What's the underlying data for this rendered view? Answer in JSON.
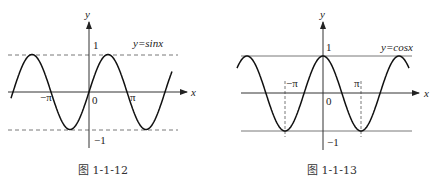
{
  "figures": [
    {
      "id": "left",
      "caption": "图 1-1-12",
      "function_label": "y=sinx",
      "axis_x_label": "x",
      "axis_y_label": "y",
      "origin_label": "0",
      "ticks": {
        "y_pos": "1",
        "y_neg": "−1",
        "x_neg": "−π",
        "x_pos": "π"
      },
      "guide_style": "dashed"
    },
    {
      "id": "right",
      "caption": "图 1-1-13",
      "function_label": "y=cosx",
      "axis_x_label": "x",
      "axis_y_label": "y",
      "origin_label": "0",
      "ticks": {
        "y_pos": "1",
        "y_neg": "−1",
        "x_neg": "−π",
        "x_pos": "π"
      },
      "guide_style": "solid"
    }
  ],
  "chart_data": [
    {
      "type": "line",
      "title": "y=sinx",
      "caption": "图 1-1-12",
      "xlabel": "x",
      "ylabel": "y",
      "x_range": [
        "-2.05π",
        "2.2π"
      ],
      "ylim": [
        -1,
        1
      ],
      "x_ticks": [
        "−π",
        "0",
        "π"
      ],
      "y_ticks": [
        "1",
        "−1"
      ],
      "reference_lines": [
        {
          "y": 1,
          "style": "dashed"
        },
        {
          "y": -1,
          "style": "dashed"
        }
      ],
      "series": [
        {
          "name": "sin x",
          "function": "sin(x)"
        }
      ]
    },
    {
      "type": "line",
      "title": "y=cosx",
      "caption": "图 1-1-13",
      "xlabel": "x",
      "ylabel": "y",
      "x_range": [
        "-2.25π",
        "2.25π"
      ],
      "ylim": [
        -1,
        1
      ],
      "x_ticks": [
        "−π",
        "0",
        "π"
      ],
      "y_ticks": [
        "1",
        "−1"
      ],
      "reference_lines": [
        {
          "y": 1,
          "style": "solid"
        },
        {
          "y": -1,
          "style": "solid"
        },
        {
          "x": "−π",
          "style": "dashed"
        },
        {
          "x": "π",
          "style": "dashed"
        }
      ],
      "series": [
        {
          "name": "cos x",
          "function": "cos(x)"
        }
      ]
    }
  ]
}
